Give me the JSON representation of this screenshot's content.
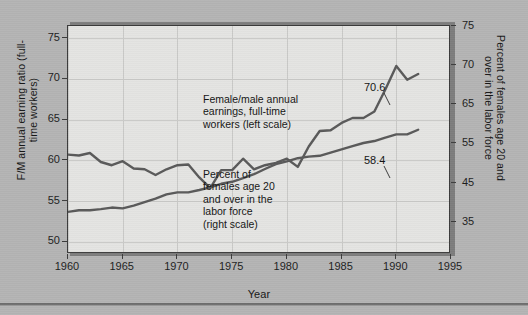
{
  "chart_data": {
    "type": "line",
    "title": "",
    "xlabel": "Year",
    "ylabel": "F/M annual earning ratio (full-time workers)",
    "ylabel_right": "Percent of females age 20 and over in the labor force",
    "xlim": [
      1960,
      1995
    ],
    "ylim_left": [
      48.5,
      76.5
    ],
    "grid": true,
    "legend": "inline-annotations",
    "x_ticks": [
      "1960",
      "1965",
      "1970",
      "1975",
      "1980",
      "1985",
      "1990",
      "1995"
    ],
    "y_ticks_left": [
      "75",
      "70",
      "65",
      "60",
      "55",
      "50"
    ],
    "y_ticks_right": [
      "75",
      "70",
      "65",
      "55",
      "45",
      "35"
    ],
    "series": [
      {
        "name": "Female/male annual earnings, full-time workers (left scale)",
        "axis": "left",
        "color": "#595959",
        "end_label": "70.6",
        "x": [
          1960,
          1961,
          1962,
          1963,
          1964,
          1965,
          1966,
          1967,
          1968,
          1969,
          1970,
          1971,
          1972,
          1973,
          1974,
          1975,
          1976,
          1977,
          1978,
          1979,
          1980,
          1981,
          1982,
          1983,
          1984,
          1985,
          1986,
          1987,
          1988,
          1989,
          1990,
          1991,
          1992
        ],
        "values": [
          60.7,
          60.6,
          60.9,
          59.8,
          59.4,
          59.9,
          59.0,
          58.9,
          58.2,
          58.9,
          59.4,
          59.5,
          57.9,
          56.6,
          58.8,
          58.8,
          60.2,
          58.9,
          59.4,
          59.7,
          60.2,
          59.2,
          61.7,
          63.6,
          63.7,
          64.6,
          65.2,
          65.2,
          66.0,
          68.7,
          71.6,
          69.9,
          70.6
        ]
      },
      {
        "name": "Percent of females age 20 and over in the labor force (right scale)",
        "axis": "right",
        "color": "#595959",
        "end_label": "58.4",
        "x": [
          1960,
          1961,
          1962,
          1963,
          1964,
          1965,
          1966,
          1967,
          1968,
          1969,
          1970,
          1971,
          1972,
          1973,
          1974,
          1975,
          1976,
          1977,
          1978,
          1979,
          1980,
          1981,
          1982,
          1983,
          1984,
          1985,
          1986,
          1987,
          1988,
          1989,
          1990,
          1991,
          1992
        ],
        "values": [
          37.6,
          38.0,
          38.0,
          38.3,
          38.7,
          38.5,
          39.2,
          40.1,
          41.0,
          42.1,
          42.6,
          42.6,
          43.2,
          43.9,
          44.8,
          45.3,
          46.2,
          47.2,
          48.5,
          49.7,
          50.4,
          51.2,
          51.6,
          51.8,
          52.6,
          53.4,
          54.2,
          55.0,
          55.5,
          56.4,
          57.2,
          57.2,
          58.4
        ]
      }
    ],
    "annotations": [
      {
        "text": "Female/male annual\nearnings, full-time\nworkers (left scale)"
      },
      {
        "text": "Percent of\nfemales age 20\nand over in the\nlabor force\n(right scale)"
      }
    ]
  },
  "axes": {
    "x_title": "Year",
    "y_title_left": "F/M annual earning ratio\n(full-time workers)",
    "y_title_right": "Percent of females age 20 and\nover in the labor force"
  },
  "colors": {
    "background": "#b4b4b4",
    "plot_background": "#e4e4e2",
    "line": "#595959",
    "frame": "#3b3b3b",
    "grid": "#c9c9c7",
    "text": "#141414"
  }
}
